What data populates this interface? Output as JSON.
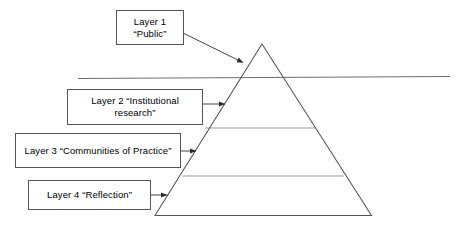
{
  "diagram": {
    "type": "layered-pyramid",
    "title": "",
    "colors": {
      "stroke": "#55565a",
      "pyramid_stroke": "#55565a",
      "divider_stroke": "#8a8b8f",
      "text": "#000000",
      "background": "#ffffff"
    },
    "callouts": [
      {
        "id": "layer1",
        "label": "Layer 1\n“Public”",
        "target": "pyramid-apex-section"
      },
      {
        "id": "layer2",
        "label": "Layer 2 “Institutional\nresearch”",
        "target": "pyramid-section-2"
      },
      {
        "id": "layer3",
        "label": "Layer 3 “Communities of Practice”",
        "target": "pyramid-section-3"
      },
      {
        "id": "layer4",
        "label": "Layer 4 “Reflection”",
        "target": "pyramid-section-4"
      }
    ],
    "pyramid": {
      "apex": [
        262,
        44
      ],
      "base_left": [
        155,
        216
      ],
      "base_right": [
        371,
        216
      ],
      "dividers": [
        {
          "y": 128,
          "x1": 205,
          "x2": 316
        },
        {
          "y": 176,
          "x1": 182,
          "x2": 344
        }
      ]
    },
    "waterline": {
      "name": "horizon-line",
      "x1": 78,
      "y1": 78,
      "x2": 450,
      "y2": 76
    },
    "arrows": [
      {
        "id": "arrow-layer1",
        "x1": 184,
        "y1": 34,
        "x2": 245,
        "y2": 64
      },
      {
        "id": "arrow-layer2",
        "x1": 203,
        "y1": 104,
        "x2": 227,
        "y2": 104
      },
      {
        "id": "arrow-layer3",
        "x1": 181,
        "y1": 151,
        "x2": 198,
        "y2": 151
      },
      {
        "id": "arrow-layer4",
        "x1": 151,
        "y1": 195,
        "x2": 169,
        "y2": 195
      }
    ]
  }
}
